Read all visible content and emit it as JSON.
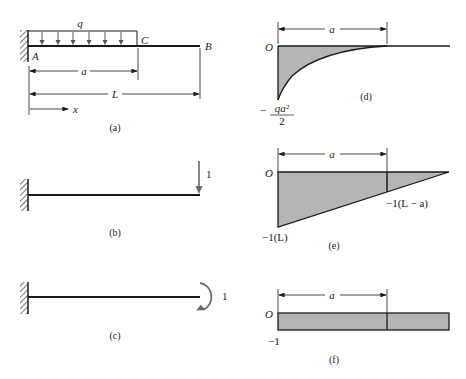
{
  "panels": {
    "a": {
      "caption": "(a)",
      "load_label": "q",
      "point_A": "A",
      "point_B": "B",
      "point_C": "C",
      "dim_a": "a",
      "dim_L": "L",
      "axis_x": "x"
    },
    "b": {
      "caption": "(b)",
      "load_label": "1"
    },
    "c": {
      "caption": "(c)",
      "moment_label": "1"
    },
    "d": {
      "caption": "(d)",
      "origin": "O",
      "dim_a": "a",
      "value_num": "qa²",
      "value_den": "2",
      "value_sign": "−"
    },
    "e": {
      "caption": "(e)",
      "origin": "O",
      "dim_a": "a",
      "value_end": "−1(L)",
      "value_mid": "−1(L − a)"
    },
    "f": {
      "caption": "(f)",
      "origin": "O",
      "dim_a": "a",
      "value": "−1"
    }
  },
  "colors": {
    "fill": "#b5b5b5",
    "stroke": "#1a1a1a",
    "arrow_gray": "#6a6a6a"
  }
}
